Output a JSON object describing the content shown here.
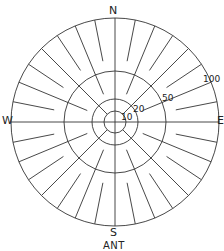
{
  "figure": {
    "caption": "ANT",
    "center": [
      115,
      122
    ],
    "stroke_color": "#333333",
    "background": "#ffffff"
  },
  "cardinals": {
    "north": "N",
    "east": "E",
    "south": "S",
    "west": "W"
  },
  "rings": [
    {
      "value": 10,
      "label": "10",
      "radius": 11
    },
    {
      "value": 20,
      "label": "20",
      "radius": 23
    },
    {
      "value": 50,
      "label": "50",
      "radius": 51
    },
    {
      "value": 100,
      "label": "100",
      "radius": 104
    }
  ],
  "spokes": {
    "count": 32,
    "step_degrees": 11.25,
    "cardinal_inner_radius": 0,
    "diagonal45_inner_radius": 11,
    "diagonal22_inner_radius": 30,
    "minor_inner_radius": 62,
    "outer_radius": 104
  }
}
